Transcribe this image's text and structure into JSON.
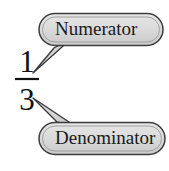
{
  "figure": {
    "background_color": "#ffffff"
  },
  "fraction": {
    "numerator": "1",
    "denominator": "3",
    "bar_color": "#111111",
    "text_color": "#111111"
  },
  "callouts": [
    {
      "id": "numerator",
      "label": "Numerator",
      "points_to": "numerator",
      "fill_color": "#d9d9d9",
      "stroke_color": "#3c3c3c",
      "text_color": "#1a1a1a"
    },
    {
      "id": "denominator",
      "label": "Denominator",
      "points_to": "denominator",
      "fill_color": "#d9d9d9",
      "stroke_color": "#3c3c3c",
      "text_color": "#1a1a1a"
    }
  ]
}
